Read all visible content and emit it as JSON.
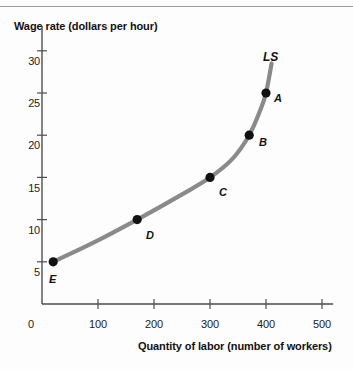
{
  "chart_data": {
    "type": "line",
    "title": "",
    "ylabel": "Wage rate (dollars per hour)",
    "xlabel": "Quantity of labor (number of workers)",
    "xlim": [
      0,
      520
    ],
    "ylim": [
      0,
      32
    ],
    "grid": false,
    "legend": "none",
    "curve_name": "LS",
    "curve_color": "#8a8a8a",
    "point_color": "#111111",
    "axis_color": "#4d4d4d",
    "x_ticks": [
      "0",
      "100",
      "200",
      "300",
      "400",
      "500"
    ],
    "x_tick_values": [
      0,
      100,
      200,
      300,
      400,
      500
    ],
    "y_ticks": [
      "5",
      "10",
      "15",
      "20",
      "25",
      "30"
    ],
    "y_tick_values": [
      5,
      10,
      15,
      20,
      25,
      30
    ],
    "points": [
      {
        "label": "A",
        "x": 400,
        "y": 25
      },
      {
        "label": "B",
        "x": 370,
        "y": 20
      },
      {
        "label": "C",
        "x": 300,
        "y": 15
      },
      {
        "label": "D",
        "x": 170,
        "y": 10
      },
      {
        "label": "E",
        "x": 20,
        "y": 5
      }
    ],
    "curve_points": [
      {
        "x": 20,
        "y": 5
      },
      {
        "x": 90,
        "y": 7.2
      },
      {
        "x": 170,
        "y": 10
      },
      {
        "x": 240,
        "y": 12.6
      },
      {
        "x": 300,
        "y": 15
      },
      {
        "x": 340,
        "y": 17.2
      },
      {
        "x": 370,
        "y": 20
      },
      {
        "x": 390,
        "y": 23
      },
      {
        "x": 400,
        "y": 25
      },
      {
        "x": 410,
        "y": 28.5
      }
    ]
  },
  "labels": {
    "origin": "0",
    "y_axis_title": "Wage rate (dollars per hour)",
    "x_axis_title": "Quantity of labor (number of workers)",
    "curve": "LS",
    "point_a": "A",
    "point_b": "B",
    "point_c": "C",
    "point_d": "D",
    "point_e": "E",
    "y_tick_5": "5",
    "y_tick_10": "10",
    "y_tick_15": "15",
    "y_tick_20": "20",
    "y_tick_25": "25",
    "y_tick_30": "30",
    "x_tick_0": "0",
    "x_tick_100": "100",
    "x_tick_200": "200",
    "x_tick_300": "300",
    "x_tick_400": "400",
    "x_tick_500": "500"
  }
}
